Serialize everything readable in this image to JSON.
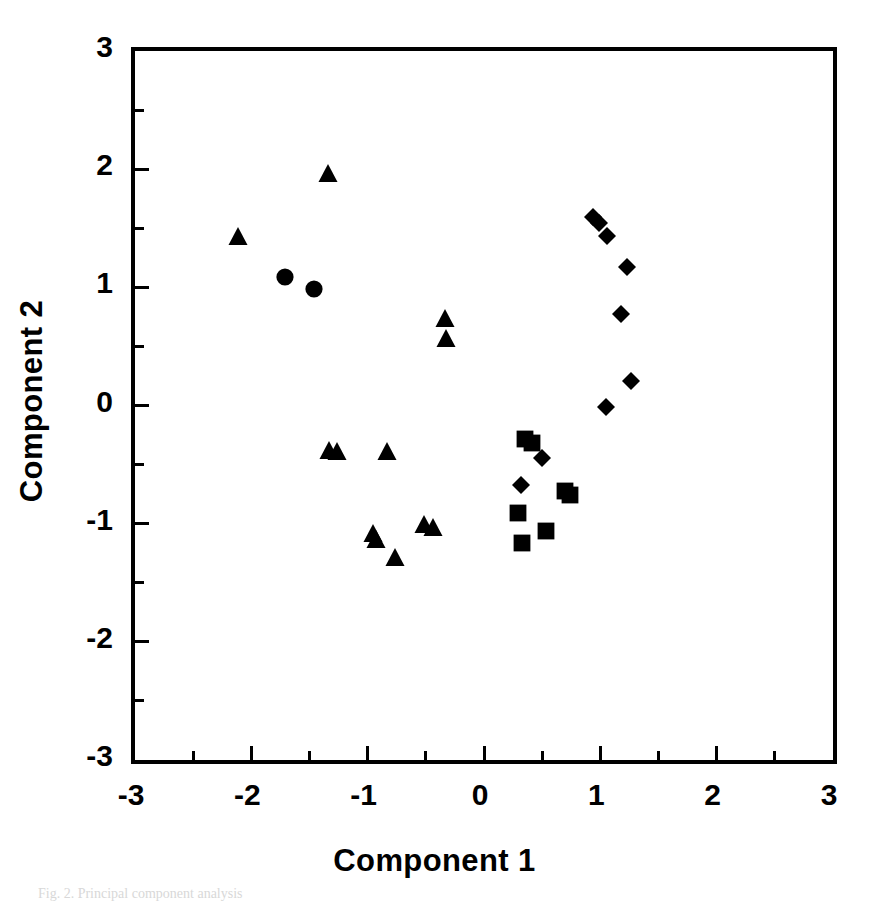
{
  "chart_data": {
    "type": "scatter",
    "title": "",
    "xlabel": "Component 1",
    "ylabel": "Component 2",
    "xlim": [
      -3,
      3
    ],
    "ylim": [
      -3,
      3
    ],
    "grid": false,
    "legend": "none",
    "x_ticks": [
      "-3",
      "-2",
      "-1",
      "0",
      "1",
      "2",
      "3"
    ],
    "x_tick_values": [
      -3,
      -2,
      -1,
      0,
      1,
      2,
      3
    ],
    "y_ticks": [
      "3",
      "2",
      "1",
      "0",
      "-1",
      "-2",
      "-3"
    ],
    "y_tick_values": [
      3,
      2,
      1,
      0,
      -1,
      -2,
      -3
    ],
    "minor_tick_step": 0.5,
    "marker_color": "#000000",
    "series": [
      {
        "name": "triangles",
        "marker": "triangle",
        "color": "#000000",
        "points": [
          [
            -1.31,
            1.93
          ],
          [
            -2.08,
            1.4
          ],
          [
            -0.3,
            0.71
          ],
          [
            -0.29,
            0.54
          ],
          [
            -1.3,
            -0.41
          ],
          [
            -1.23,
            -0.42
          ],
          [
            -0.8,
            -0.42
          ],
          [
            -0.92,
            -1.11
          ],
          [
            -0.89,
            -1.16
          ],
          [
            -0.48,
            -1.04
          ],
          [
            -0.4,
            -1.06
          ],
          [
            -0.73,
            -1.32
          ]
        ]
      },
      {
        "name": "circles",
        "marker": "circle",
        "color": "#000000",
        "points": [
          [
            -1.68,
            1.05
          ],
          [
            -1.43,
            0.95
          ]
        ]
      },
      {
        "name": "diamonds",
        "marker": "diamond",
        "color": "#000000",
        "points": [
          [
            0.97,
            1.56
          ],
          [
            1.02,
            1.51
          ],
          [
            1.09,
            1.4
          ],
          [
            1.26,
            1.14
          ],
          [
            1.21,
            0.74
          ],
          [
            1.3,
            0.17
          ],
          [
            1.08,
            -0.05
          ],
          [
            0.53,
            -0.48
          ],
          [
            0.35,
            -0.71
          ]
        ]
      },
      {
        "name": "squares",
        "marker": "square",
        "color": "#000000",
        "points": [
          [
            0.39,
            -0.32
          ],
          [
            0.45,
            -0.35
          ],
          [
            0.73,
            -0.76
          ],
          [
            0.77,
            -0.79
          ],
          [
            0.33,
            -0.94
          ],
          [
            0.57,
            -1.1
          ],
          [
            0.36,
            -1.2
          ]
        ]
      }
    ]
  },
  "caption": {
    "text": "Fig. 2. Principal component analysis"
  }
}
